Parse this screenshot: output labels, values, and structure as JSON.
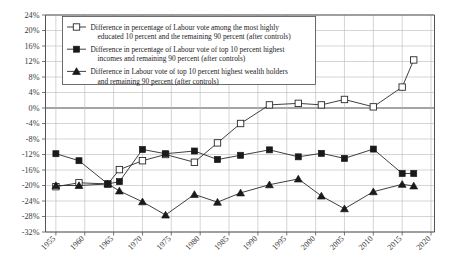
{
  "chart_data": {
    "type": "line",
    "title": "",
    "xlabel": "",
    "ylabel": "",
    "xlim": [
      1953,
      2020
    ],
    "ylim": [
      -32,
      24
    ],
    "ytick_step": 4,
    "grid": true,
    "legend_position": "top-left",
    "ytick_labels": [
      "24%",
      "20%",
      "16%",
      "12%",
      "8%",
      "4%",
      "0%",
      "-4%",
      "-8%",
      "-12%",
      "-16%",
      "-20%",
      "-24%",
      "-28%",
      "-32%"
    ],
    "ytick_values": [
      24,
      20,
      16,
      12,
      8,
      4,
      0,
      -4,
      -8,
      -12,
      -16,
      -20,
      -24,
      -28,
      -32
    ],
    "xtick_labels": [
      "1955",
      "1960",
      "1965",
      "1970",
      "1975",
      "1980",
      "1985",
      "1990",
      "1995",
      "2000",
      "2005",
      "2010",
      "2015",
      "2020"
    ],
    "xtick_values": [
      1955,
      1960,
      1965,
      1970,
      1975,
      1980,
      1985,
      1990,
      1995,
      2000,
      2005,
      2010,
      2015,
      2020
    ],
    "series": [
      {
        "name": "Difference in percentage of Labour vote among the most highly educated 10 percent and the remaining 90 percent (after controls)",
        "marker": "open-square",
        "x": [
          1955,
          1959,
          1964,
          1966,
          1970,
          1974,
          1979,
          1983,
          1987,
          1992,
          1997,
          2001,
          2005,
          2010,
          2015,
          2017
        ],
        "values": [
          -20.3,
          -19.3,
          -19.6,
          -15.9,
          -13.6,
          -12.0,
          -14.0,
          -9.0,
          -4.0,
          0.8,
          1.2,
          0.8,
          2.2,
          0.3,
          5.4,
          12.4
        ]
      },
      {
        "name": "Difference in percentage of Labour vote of top 10 percent highest incomes and remaining 90 percent (after controls)",
        "marker": "filled-square",
        "x": [
          1955,
          1959,
          1964,
          1966,
          1970,
          1974,
          1979,
          1983,
          1987,
          1992,
          1997,
          2001,
          2005,
          2010,
          2015,
          2017
        ],
        "values": [
          -11.8,
          -13.6,
          -19.6,
          -19.0,
          -10.7,
          -11.8,
          -11.1,
          -13.3,
          -12.2,
          -10.8,
          -12.6,
          -11.7,
          -13.0,
          -10.6,
          -16.9,
          -16.9
        ]
      },
      {
        "name": "Difference in Labour vote of top 10 percent highest wealth holders and remaining 90 percent (after controls)",
        "marker": "filled-triangle",
        "x": [
          1955,
          1959,
          1964,
          1966,
          1970,
          1974,
          1979,
          1983,
          1987,
          1992,
          1997,
          2001,
          2005,
          2010,
          2015,
          2017
        ],
        "values": [
          -20.0,
          -20.0,
          -19.6,
          -21.4,
          -24.2,
          -27.6,
          -22.3,
          -24.3,
          -21.9,
          -19.8,
          -18.3,
          -22.7,
          -26.0,
          -21.6,
          -19.7,
          -20.1
        ]
      }
    ]
  },
  "legend": {
    "entries": [
      {
        "marker": "open-square",
        "line1": "Difference in percentage of Labour vote among the most highly",
        "line2": "educated 10 percent and the remaining 90 percent (after controls)"
      },
      {
        "marker": "filled-square",
        "line1": "Difference in percentage of Labour vote of top 10 percent highest",
        "line2": "incomes and remaining 90 percent (after controls)"
      },
      {
        "marker": "filled-triangle",
        "line1": "Difference in Labour vote of top 10 percent highest wealth holders",
        "line2": "and remaining 90 percent (after controls)"
      }
    ]
  },
  "colors": {
    "ink": "#1a1a1a",
    "grid": "#b9b9b9",
    "axis": "#555555",
    "background": "#ffffff"
  }
}
